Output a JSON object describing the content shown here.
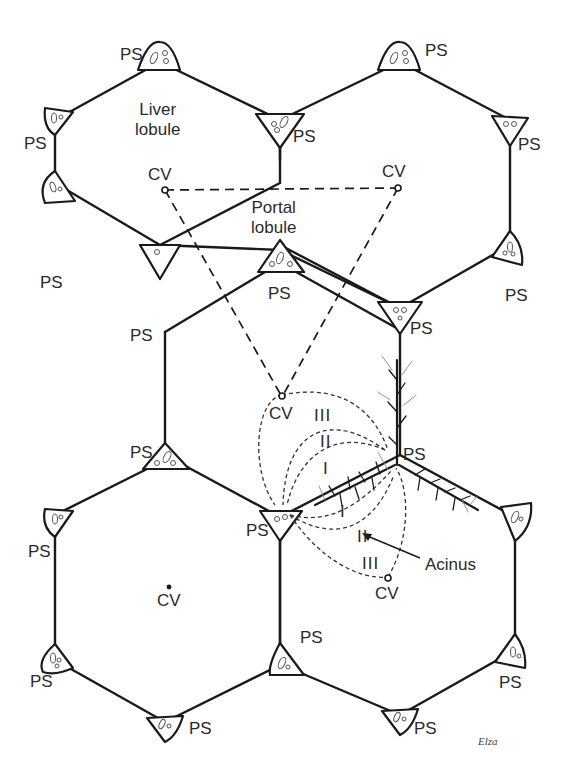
{
  "figure": {
    "labels": {
      "portal_space": "PS",
      "central_vein": "CV",
      "liver_lobule_line1": "Liver",
      "liver_lobule_line2": "lobule",
      "portal_lobule_line1": "Portal",
      "portal_lobule_line2": "lobule",
      "acinus": "Acinus",
      "zone_1": "I",
      "zone_2": "II",
      "zone_3": "III",
      "signature": "Elza"
    },
    "ps_labels": [
      {
        "id": "ps-1",
        "text": "PS"
      },
      {
        "id": "ps-2",
        "text": "PS"
      },
      {
        "id": "ps-3",
        "text": "PS"
      },
      {
        "id": "ps-4",
        "text": "PS"
      },
      {
        "id": "ps-5",
        "text": "PS"
      },
      {
        "id": "ps-6",
        "text": "PS"
      },
      {
        "id": "ps-7",
        "text": "PS"
      },
      {
        "id": "ps-8",
        "text": "PS"
      },
      {
        "id": "ps-9",
        "text": "PS"
      },
      {
        "id": "ps-10",
        "text": "PS"
      },
      {
        "id": "ps-11",
        "text": "PS"
      },
      {
        "id": "ps-12",
        "text": "PS"
      },
      {
        "id": "ps-13",
        "text": "PS"
      },
      {
        "id": "ps-14",
        "text": "PS"
      },
      {
        "id": "ps-15",
        "text": "PS"
      },
      {
        "id": "ps-16",
        "text": "PS"
      },
      {
        "id": "ps-17",
        "text": "PS"
      },
      {
        "id": "ps-18",
        "text": "PS"
      },
      {
        "id": "ps-19",
        "text": "PS"
      }
    ],
    "cv_labels": [
      {
        "id": "cv-top-left",
        "text": "CV"
      },
      {
        "id": "cv-top-right",
        "text": "CV"
      },
      {
        "id": "cv-middle",
        "text": "CV"
      },
      {
        "id": "cv-bottom-left",
        "text": "CV"
      },
      {
        "id": "cv-bottom-right",
        "text": "CV"
      }
    ],
    "colors": {
      "line": "#1a1a1a",
      "text": "#2a2a2a",
      "background": "#ffffff"
    }
  }
}
